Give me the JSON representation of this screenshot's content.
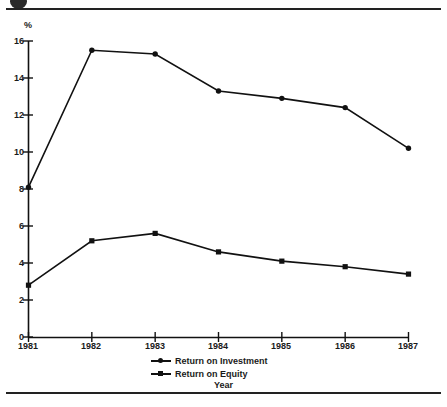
{
  "figure": {
    "top_rule": "",
    "bottom_rule": "",
    "unit_label": "%",
    "x_axis_title": "Year"
  },
  "chart_data": {
    "type": "line",
    "title": "",
    "subtitle": "",
    "xlabel": "Year",
    "ylabel": "%",
    "categories": [
      "1981",
      "1982",
      "1983",
      "1984",
      "1985",
      "1986",
      "1987"
    ],
    "x": [
      1981,
      1982,
      1983,
      1984,
      1985,
      1986,
      1987
    ],
    "series": [
      {
        "name": "Return on Investment",
        "marker": "circle",
        "color": "#111111",
        "values": [
          8.1,
          15.5,
          15.3,
          13.3,
          12.9,
          12.4,
          10.2
        ]
      },
      {
        "name": "Return on Equity",
        "marker": "square",
        "color": "#111111",
        "values": [
          2.8,
          5.2,
          5.6,
          4.6,
          4.1,
          3.8,
          3.4
        ]
      }
    ],
    "ylim": [
      0,
      16
    ],
    "xlim": [
      1981,
      1987
    ],
    "ytick_labels": [
      "0",
      "2",
      "4",
      "6",
      "8",
      "10",
      "12",
      "14",
      "16"
    ],
    "yticks": [
      0,
      2,
      4,
      6,
      8,
      10,
      12,
      14,
      16
    ],
    "xtick_labels": [
      "1981",
      "1982",
      "1983",
      "1984",
      "1985",
      "1986",
      "1987"
    ],
    "grid": false,
    "legend_position": "bottom-center",
    "legend": [
      "Return on Investment",
      "Return on Equity"
    ]
  }
}
